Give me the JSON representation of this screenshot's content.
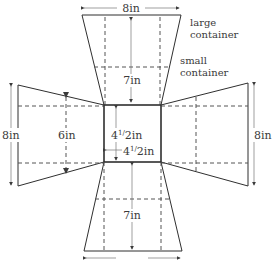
{
  "diagram": {
    "colors": {
      "line": "#2f2f2f",
      "dash": "#555555",
      "text": "#3a3a3a",
      "bg": "#ffffff"
    },
    "labels": {
      "top_width": "8in",
      "large_container": [
        "large",
        "container"
      ],
      "small_container": [
        "small",
        "container"
      ],
      "top_height": "7in",
      "left_height": "8in",
      "left_inner": "6in",
      "center_vertical": {
        "whole": "4",
        "frac_num": "1",
        "frac_den": "2",
        "unit": "in"
      },
      "center_horizontal": {
        "whole": "4",
        "frac_num": "1",
        "frac_den": "2",
        "unit": "in"
      },
      "right_height": "8in",
      "bottom_height": "7in"
    },
    "geometry": {
      "center_square": {
        "x1": 104,
        "y1": 105,
        "x2": 161,
        "y2": 162
      },
      "top_panel": {
        "outer_y": 15,
        "outer_x1": 82,
        "outer_x2": 181
      },
      "bottom_panel": {
        "outer_y": 251,
        "outer_x1": 84,
        "outer_x2": 182
      },
      "left_panel": {
        "outer_x": 18,
        "outer_y1": 85,
        "outer_y2": 186
      },
      "right_panel": {
        "outer_x": 248,
        "outer_y1": 83,
        "outer_y2": 186
      }
    }
  }
}
